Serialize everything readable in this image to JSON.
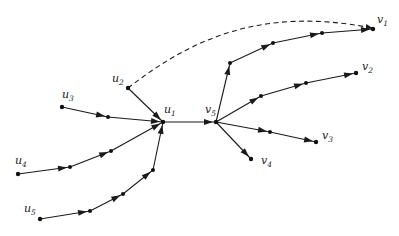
{
  "diagram": {
    "type": "directed-graph",
    "nodes": [
      {
        "id": "u1",
        "label": "u",
        "sub": "1",
        "x": 163,
        "y": 122,
        "lx": 164,
        "ly": 113
      },
      {
        "id": "u2",
        "label": "u",
        "sub": "2",
        "x": 128,
        "y": 88,
        "lx": 112,
        "ly": 82
      },
      {
        "id": "u3",
        "label": "u",
        "sub": "3",
        "x": 62,
        "y": 107,
        "lx": 62,
        "ly": 98
      },
      {
        "id": "u4",
        "label": "u",
        "sub": "4",
        "x": 18,
        "y": 174,
        "lx": 15,
        "ly": 164
      },
      {
        "id": "u5",
        "label": "u",
        "sub": "5",
        "x": 40,
        "y": 219,
        "lx": 24,
        "ly": 212
      },
      {
        "id": "v5",
        "label": "v",
        "sub": "5",
        "x": 216,
        "y": 122,
        "lx": 205,
        "ly": 113
      },
      {
        "id": "v1",
        "label": "v",
        "sub": "1",
        "x": 373,
        "y": 29,
        "lx": 377,
        "ly": 23
      },
      {
        "id": "v2",
        "label": "v",
        "sub": "2",
        "x": 356,
        "y": 73,
        "lx": 362,
        "ly": 70
      },
      {
        "id": "v3",
        "label": "v",
        "sub": "3",
        "x": 316,
        "y": 142,
        "lx": 322,
        "ly": 139
      },
      {
        "id": "v4",
        "label": "v",
        "sub": "4",
        "x": 251,
        "y": 159,
        "lx": 261,
        "ly": 164
      }
    ],
    "intermediate_points": [
      {
        "x": 108,
        "y": 117
      },
      {
        "x": 70,
        "y": 167
      },
      {
        "x": 111,
        "y": 151
      },
      {
        "x": 90,
        "y": 211
      },
      {
        "x": 123,
        "y": 194
      },
      {
        "x": 153,
        "y": 170
      },
      {
        "x": 230,
        "y": 63
      },
      {
        "x": 273,
        "y": 43
      },
      {
        "x": 322,
        "y": 33
      },
      {
        "x": 261,
        "y": 96
      },
      {
        "x": 306,
        "y": 83
      },
      {
        "x": 270,
        "y": 132
      }
    ],
    "paths": [
      {
        "from": "u2",
        "points": [
          [
            128,
            88
          ],
          [
            163,
            122
          ]
        ]
      },
      {
        "from": "u3",
        "points": [
          [
            62,
            107
          ],
          [
            108,
            117
          ],
          [
            163,
            122
          ]
        ]
      },
      {
        "from": "u4",
        "points": [
          [
            18,
            174
          ],
          [
            70,
            167
          ],
          [
            111,
            151
          ],
          [
            163,
            122
          ]
        ]
      },
      {
        "from": "u5",
        "points": [
          [
            40,
            219
          ],
          [
            90,
            211
          ],
          [
            123,
            194
          ],
          [
            153,
            170
          ],
          [
            163,
            122
          ]
        ]
      },
      {
        "from": "u1",
        "points": [
          [
            163,
            122
          ],
          [
            216,
            122
          ]
        ]
      },
      {
        "from": "v5",
        "points": [
          [
            216,
            122
          ],
          [
            230,
            63
          ],
          [
            273,
            43
          ],
          [
            322,
            33
          ],
          [
            373,
            29
          ]
        ]
      },
      {
        "from": "v5",
        "points": [
          [
            216,
            122
          ],
          [
            261,
            96
          ],
          [
            306,
            83
          ],
          [
            356,
            73
          ]
        ]
      },
      {
        "from": "v5",
        "points": [
          [
            216,
            122
          ],
          [
            270,
            132
          ],
          [
            316,
            142
          ]
        ]
      },
      {
        "from": "v5",
        "points": [
          [
            216,
            122
          ],
          [
            251,
            159
          ]
        ]
      }
    ],
    "dashed_edge": {
      "from": "u2",
      "to": "v1",
      "path": "M128,88 C190,40 260,6 372,28"
    },
    "colors": {
      "edge": "#1a1a1a",
      "node": "#111111",
      "label": "#222222",
      "background": "#ffffff"
    }
  }
}
